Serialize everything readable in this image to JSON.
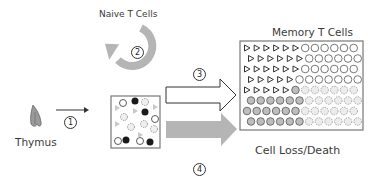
{
  "labels": {
    "naive": "Naive T Cells",
    "memory": "Memory T Cells",
    "thymus": "Thymus",
    "loss": "Cell Loss/Death"
  },
  "steps": {
    "s1": "1",
    "s2": "2",
    "s3": "3",
    "s4": "4"
  },
  "colors": {
    "gray_arrow": "#b5b5b5",
    "box_border": "#777777",
    "black_cell": "#1a1a1a",
    "gray_cell": "#b0b0b0",
    "thymus": "#8a8a8a"
  }
}
